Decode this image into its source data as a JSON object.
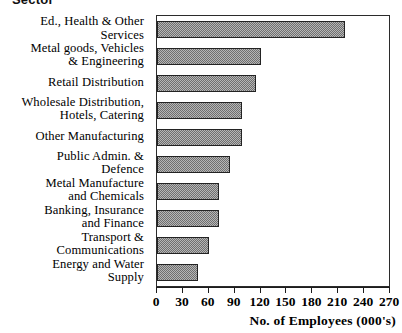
{
  "heading": {
    "text": "Sector"
  },
  "chart_data": {
    "type": "bar",
    "orientation": "horizontal",
    "title": "Sector",
    "xlabel": "No. of Employees (000's)",
    "ylabel": "Sector",
    "xlim": [
      0,
      270
    ],
    "xticks": [
      0,
      30,
      60,
      90,
      120,
      150,
      180,
      210,
      240,
      270
    ],
    "xtick_labels": [
      "0",
      "30",
      "60",
      "90",
      "120",
      "150",
      "180",
      "210",
      "240",
      "270"
    ],
    "grid": false,
    "legend": null,
    "bar_style": {
      "fill": "#b6b6b6",
      "pattern": "checkerboard-dither",
      "edge": "#232323"
    },
    "categories": [
      "Ed., Health & Other\nServices",
      "Metal goods, Vehicles\n& Engineering",
      "Retail Distribution",
      "Wholesale Distribution,\nHotels, Catering",
      "Other Manufacturing",
      "Public Admin. &\nDefence",
      "Metal Manufacture\nand Chemicals",
      "Banking, Insurance\nand Finance",
      "Transport &\nCommunications",
      "Energy and Water\nSupply"
    ],
    "values": [
      218,
      120,
      115,
      98,
      98,
      85,
      72,
      72,
      60,
      48
    ],
    "units": "thousands of employees"
  }
}
